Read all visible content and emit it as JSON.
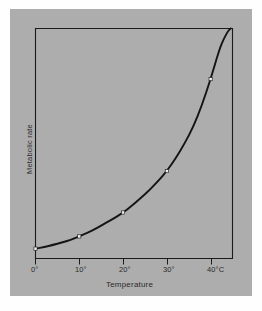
{
  "figure": {
    "background_color": "#adadad",
    "page_color": "#fefefe",
    "ink_color": "#1a1a1a",
    "marker_fill": "#f2f0ec"
  },
  "chart_data": {
    "type": "line",
    "title": "",
    "subtitle": "",
    "xlabel": "Temperature",
    "ylabel": "Metabolic rate",
    "xlim": [
      0,
      45
    ],
    "ylim": [
      0,
      100
    ],
    "grid": false,
    "legend": "none",
    "xtick_labels": [
      "0°",
      "10°",
      "20°",
      "30°",
      "40°C"
    ],
    "xtick_values": [
      0,
      10,
      20,
      30,
      40
    ],
    "ytick_labels": [],
    "annotations": [],
    "series": [
      {
        "name": "Metabolic rate",
        "x": [
          0,
          10,
          20,
          30,
          40
        ],
        "values": [
          4.3,
          9.6,
          20,
          38,
          78
        ],
        "marker": "square",
        "line_style": "solid",
        "extends_beyond_last_point": true,
        "curve_x": [
          0,
          2,
          4,
          6,
          8,
          10,
          12,
          14,
          16,
          18,
          20,
          22,
          24,
          26,
          28,
          30,
          32,
          34,
          36,
          38,
          40,
          42,
          43,
          44,
          44.6
        ],
        "curve_values": [
          4.3,
          5.0,
          5.9,
          6.9,
          8.1,
          9.6,
          11.3,
          13.2,
          15.4,
          17.5,
          20.0,
          22.9,
          26.2,
          29.6,
          33.7,
          38.0,
          43.5,
          49.8,
          57.0,
          66.5,
          78.0,
          91.0,
          95.5,
          99.0,
          100.0
        ]
      }
    ]
  }
}
